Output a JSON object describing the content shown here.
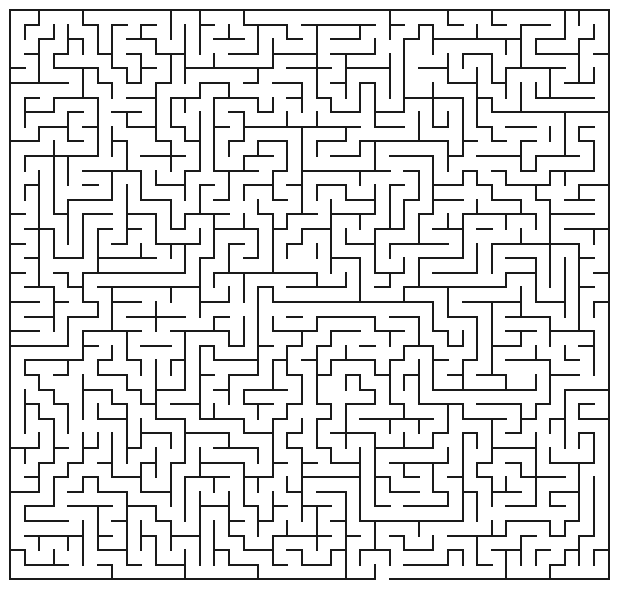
{
  "page": {
    "type": "maze",
    "width": 618,
    "height": 594,
    "background_color": "#ffffff"
  },
  "maze": {
    "name": "rectangular-perfect-maze",
    "columns": 41,
    "rows": 39,
    "cell_size": 14.6,
    "origin_x": 10,
    "origin_y": 10,
    "wall_color": "#1a1a1a",
    "wall_thickness": 2,
    "passage_color": "#ffffff",
    "border": {
      "top": "closed",
      "left": "closed",
      "right": "closed",
      "bottom": "open"
    },
    "entrance": {
      "side": "bottom",
      "column": 25,
      "label": "exit-gap-bottom"
    },
    "seed": 20240517,
    "algorithm": "randomized-depth-first",
    "style": "orthogonal-grid"
  },
  "chart_data": {
    "type": "maze",
    "grid": {
      "columns": 41,
      "rows": 39
    },
    "cell_size_px": 14.6,
    "openings": [
      {
        "side": "bottom",
        "index": 25
      }
    ],
    "line_color": "#1a1a1a",
    "line_width_px": 2
  }
}
